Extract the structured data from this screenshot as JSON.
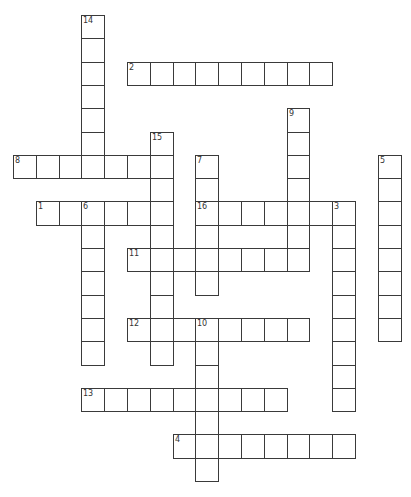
{
  "puzzle": {
    "type": "crossword",
    "layout": {
      "origin_x": 13,
      "origin_y": 15,
      "cell_w": 22.8,
      "cell_h": 23.3,
      "border_color": "#3a3a3a",
      "background": "#ffffff"
    },
    "words": [
      {
        "number": "14",
        "direction": "down",
        "col": 3,
        "row": 0,
        "length": 7
      },
      {
        "number": "2",
        "direction": "across",
        "col": 5,
        "row": 2,
        "length": 9
      },
      {
        "number": "9",
        "direction": "down",
        "col": 12,
        "row": 4,
        "length": 7
      },
      {
        "number": "15",
        "direction": "down",
        "col": 6,
        "row": 5,
        "length": 10
      },
      {
        "number": "8",
        "direction": "across",
        "col": 0,
        "row": 6,
        "length": 7
      },
      {
        "number": "7",
        "direction": "down",
        "col": 8,
        "row": 6,
        "length": 6
      },
      {
        "number": "5",
        "direction": "down",
        "col": 16,
        "row": 6,
        "length": 8
      },
      {
        "number": "1",
        "direction": "across",
        "col": 1,
        "row": 8,
        "length": 6
      },
      {
        "number": "6",
        "direction": "down",
        "col": 3,
        "row": 8,
        "length": 7
      },
      {
        "number": "16",
        "direction": "across",
        "col": 8,
        "row": 8,
        "length": 7
      },
      {
        "number": "3",
        "direction": "down",
        "col": 14,
        "row": 8,
        "length": 9
      },
      {
        "number": "11",
        "direction": "across",
        "col": 5,
        "row": 10,
        "length": 8
      },
      {
        "number": "12",
        "direction": "across",
        "col": 5,
        "row": 13,
        "length": 8
      },
      {
        "number": "10",
        "direction": "down",
        "col": 8,
        "row": 13,
        "length": 7
      },
      {
        "number": "13",
        "direction": "across",
        "col": 3,
        "row": 16,
        "length": 9
      },
      {
        "number": "4",
        "direction": "across",
        "col": 7,
        "row": 18,
        "length": 8
      }
    ]
  }
}
